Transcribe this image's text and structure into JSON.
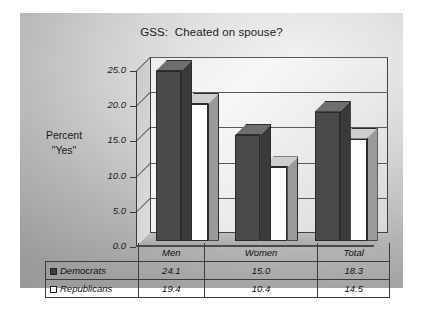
{
  "chart_data": {
    "type": "bar",
    "title": "GSS:  Cheated on spouse?",
    "xlabel": "",
    "ylabel": "Percent \"Yes\"",
    "ylabel_lines": [
      "Percent",
      "\"Yes\""
    ],
    "categories": [
      "Men",
      "Women",
      "Total"
    ],
    "series": [
      {
        "name": "Democrats",
        "values": [
          24.1,
          15.0,
          18.3
        ],
        "color": "#4a4a4a",
        "marker": "filled-square"
      },
      {
        "name": "Republicans",
        "values": [
          19.4,
          10.4,
          14.5
        ],
        "color": "#ffffff",
        "marker": "open-square"
      }
    ],
    "ylim": [
      0.0,
      25.0
    ],
    "yticks": [
      "0.0",
      "5.0",
      "10.0",
      "15.0",
      "20.0",
      "25.0"
    ],
    "ytick_values": [
      0.0,
      5.0,
      10.0,
      15.0,
      20.0,
      25.0
    ],
    "grid": true,
    "legend_position": "table-below",
    "style": "3d-column"
  },
  "table": {
    "header": [
      "",
      "Men",
      "Women",
      "Total"
    ],
    "rows": [
      {
        "label": "Democrats",
        "marker": "filled-square",
        "cells": [
          "24.1",
          "15.0",
          "18.3"
        ]
      },
      {
        "label": "Republicans",
        "marker": "open-square",
        "cells": [
          "19.4",
          "10.4",
          "14.5"
        ]
      }
    ]
  },
  "axis": {
    "ticks": [
      "25.0",
      "20.0",
      "15.0",
      "10.0",
      "5.0",
      "0.0"
    ]
  }
}
